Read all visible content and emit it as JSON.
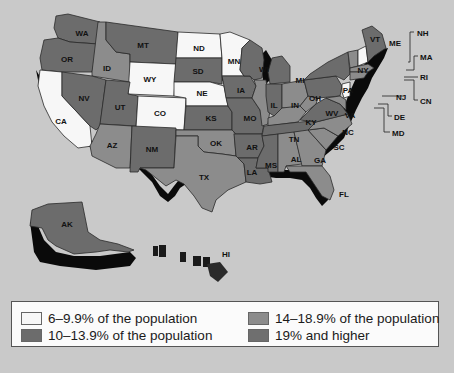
{
  "colors": {
    "background": "#c9c9c9",
    "cat_6_9": "#f7f7f7",
    "cat_10_13": "#6c6c6c",
    "cat_14_18": "#8c8c8c",
    "cat_19_plus": "#6f6f6f",
    "shadow": "#0a0a0a"
  },
  "legend": {
    "items": [
      {
        "key": "cat_6_9",
        "label": "6–9.9% of the population"
      },
      {
        "key": "cat_10_13",
        "label": "10–13.9% of the population"
      },
      {
        "key": "cat_14_18",
        "label": "14–18.9% of the population"
      },
      {
        "key": "cat_19_plus",
        "label": "19% and higher"
      }
    ]
  },
  "states": {
    "WA": "WA",
    "OR": "OR",
    "CA": "CA",
    "ID": "ID",
    "NV": "NV",
    "MT": "MT",
    "WY": "WY",
    "UT": "UT",
    "AZ": "AZ",
    "CO": "CO",
    "NM": "NM",
    "ND": "ND",
    "SD": "SD",
    "NE": "NE",
    "KS": "KS",
    "OK": "OK",
    "TX": "TX",
    "MN": "MN",
    "IA": "IA",
    "MO": "MO",
    "AR": "AR",
    "LA": "LA",
    "WI": "WI",
    "IL": "IL",
    "MS": "MS",
    "MI": "MI",
    "IN": "IN",
    "KY": "KY",
    "TN": "TN",
    "AL": "AL",
    "OH": "OH",
    "WV": "WV",
    "VA": "VA",
    "NC": "NC",
    "SC": "SC",
    "GA": "GA",
    "FL": "FL",
    "PA": "PA",
    "NY": "NY",
    "VT": "VT",
    "ME": "ME",
    "AK": "AK",
    "HI": "HI"
  },
  "callouts": {
    "NH": "NH",
    "MA": "MA",
    "RI": "RI",
    "CN": "CN",
    "NJ": "NJ",
    "DE": "DE",
    "MD": "MD"
  }
}
